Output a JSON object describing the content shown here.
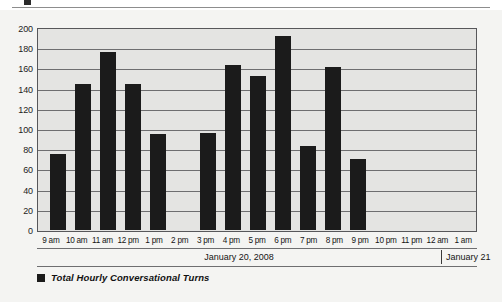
{
  "top_crop": {
    "marker_name": "page-bullet-marker"
  },
  "chart_data": {
    "type": "bar",
    "title": "",
    "subtitle": "",
    "xlabel": "",
    "ylabel": "",
    "ylim": [
      0,
      200
    ],
    "ytick_step": 20,
    "grid": true,
    "legend_position": "bottom-left",
    "bar_color": "#1b1b1b",
    "plot_background": "#e4e4e2",
    "categories": [
      "9 am",
      "10 am",
      "11 am",
      "12 pm",
      "1 pm",
      "2 pm",
      "3 pm",
      "4 pm",
      "5 pm",
      "6 pm",
      "7 pm",
      "8 pm",
      "9 pm",
      "10 pm",
      "11 pm",
      "12 am",
      "1 am"
    ],
    "values": [
      75,
      145,
      176,
      145,
      95,
      0,
      96,
      163,
      152,
      192,
      83,
      161,
      70,
      0,
      0,
      0,
      0
    ],
    "yticks": [
      200,
      180,
      160,
      140,
      120,
      100,
      80,
      60,
      40,
      20,
      0
    ],
    "series": [
      {
        "name": "Total Hourly Conversational Turns",
        "values": [
          75,
          145,
          176,
          145,
          95,
          0,
          96,
          163,
          152,
          192,
          83,
          161,
          70,
          0,
          0,
          0,
          0
        ]
      }
    ],
    "annotations": {
      "date_primary": "January 20, 2008",
      "date_secondary": "January 21",
      "date_divider_after_category": "11 pm"
    }
  },
  "legend": {
    "entries": [
      {
        "label": "Total Hourly Conversational Turns",
        "color": "#1b1b1b"
      }
    ]
  },
  "date_band": {
    "primary": "January 20, 2008",
    "secondary": "January 21"
  }
}
